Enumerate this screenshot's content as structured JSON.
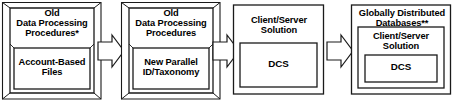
{
  "diagram": {
    "type": "process-evolution-flow",
    "direction": "left-to-right",
    "width": 454,
    "height": 110,
    "stroke_color": "#1a1a1a",
    "fill_color": "#ffffff",
    "background": "#ffffff",
    "stages": [
      {
        "id": "stage-1",
        "style": "3d-cube",
        "outer_label_lines": [
          "Old",
          "Data Processing",
          "Procedures*"
        ],
        "inner_label_lines": [
          "Account-Based",
          "Files"
        ],
        "footnote_marker": "*"
      },
      {
        "id": "stage-2",
        "style": "3d-cube",
        "outer_label_lines": [
          "Old",
          "Data Processing",
          "Procedures"
        ],
        "inner_label_lines": [
          "New Parallel",
          "ID/Taxonomy"
        ],
        "footnote_marker": ""
      },
      {
        "id": "stage-3",
        "style": "flat-rect",
        "outer_label_lines": [
          "Client/Server",
          "Solution"
        ],
        "inner_label_lines": [
          "DCS"
        ],
        "footnote_marker": ""
      },
      {
        "id": "stage-4",
        "style": "flat-rect-nested",
        "outer_label_lines": [
          "Globally Distributed",
          "Databases**"
        ],
        "middle_label_lines": [
          "Client/Server",
          "Solution"
        ],
        "inner_label_lines": [
          "DCS"
        ],
        "footnote_marker": "**"
      }
    ],
    "arrows": [
      {
        "id": "arrow-1",
        "from": "stage-1",
        "to": "stage-2",
        "shape": "block-arrow-right"
      },
      {
        "id": "arrow-2",
        "from": "stage-2",
        "to": "stage-3",
        "shape": "block-arrow-right"
      },
      {
        "id": "arrow-3",
        "from": "stage-3",
        "to": "stage-4",
        "shape": "block-arrow-right"
      }
    ]
  }
}
